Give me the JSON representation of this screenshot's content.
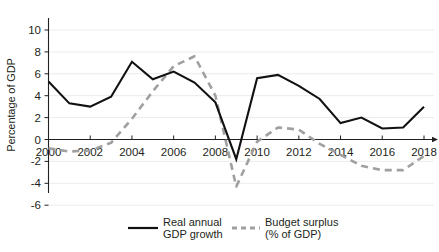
{
  "chart_data": {
    "type": "line",
    "title": "",
    "xlabel": "",
    "ylabel": "Percentage of GDP",
    "x": [
      2000,
      2001,
      2002,
      2003,
      2004,
      2005,
      2006,
      2007,
      2008,
      2009,
      2010,
      2011,
      2012,
      2013,
      2014,
      2015,
      2016,
      2017,
      2018
    ],
    "xlim": [
      2000,
      2018
    ],
    "ylim": [
      -7,
      11
    ],
    "yticks": [
      10,
      8,
      6,
      4,
      2,
      0,
      -2,
      -4,
      -6
    ],
    "xticks": [
      2000,
      2002,
      2004,
      2006,
      2008,
      2010,
      2012,
      2014,
      2016,
      2018
    ],
    "xtick_labels": [
      "2000",
      "2002",
      "2004",
      "2006",
      "2008",
      "2010",
      "2012",
      "2014",
      "2016",
      "2018"
    ],
    "ytick_labels": [
      "10",
      "8",
      "6",
      "4",
      "2",
      "0",
      "-2",
      "-4",
      "-6"
    ],
    "grid": true,
    "legend_position": "bottom",
    "series": [
      {
        "name": "Real annual GDP growth",
        "style": "solid",
        "color": "#111111",
        "values": [
          5.3,
          3.3,
          3.0,
          3.9,
          7.1,
          5.5,
          6.2,
          5.2,
          3.4,
          -1.8,
          5.6,
          5.9,
          4.9,
          3.7,
          1.5,
          2.0,
          1.0,
          1.1,
          3.0
        ]
      },
      {
        "name": "Budget surplus (% of GDP)",
        "style": "dashed",
        "color": "#a0a0a0",
        "values": [
          -0.8,
          -1.1,
          -1.0,
          -0.3,
          1.9,
          4.4,
          6.7,
          7.6,
          4.0,
          -4.3,
          -0.2,
          1.1,
          0.9,
          -0.4,
          -1.4,
          -2.4,
          -2.8,
          -2.8,
          -1.5
        ]
      }
    ]
  },
  "axis": {
    "y_title": "Percentage of GDP"
  },
  "legend": {
    "items": [
      {
        "label_line1": "Real annual",
        "label_line2": "GDP growth",
        "style": "solid"
      },
      {
        "label_line1": "Budget surplus",
        "label_line2": "(% of GDP)",
        "style": "dashed"
      }
    ]
  },
  "colors": {
    "gdp_growth": "#111111",
    "budget_surplus": "#a0a0a0",
    "axis": "#231f20",
    "grid": "#e9e9ee",
    "background": "#ffffff"
  }
}
